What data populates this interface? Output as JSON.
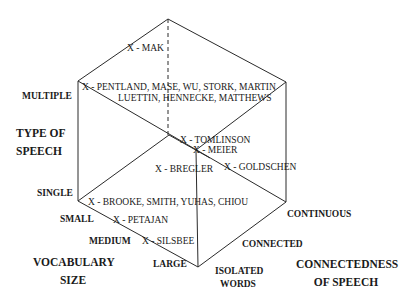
{
  "diagram": {
    "type": "3d-cube-classification",
    "axes": {
      "type_of_speech": {
        "title_line1": "TYPE OF",
        "title_line2": "SPEECH",
        "ticks": [
          "SINGLE",
          "MULTIPLE"
        ]
      },
      "vocabulary_size": {
        "title_line1": "VOCABULARY",
        "title_line2": "SIZE",
        "ticks": [
          "SMALL",
          "MEDIUM",
          "LARGE"
        ]
      },
      "connectedness": {
        "title_line1": "CONNECTEDNESS",
        "title_line2": "OF SPEECH",
        "ticks": [
          "ISOLATED",
          "WORDS",
          "CONNECTED",
          "CONTINUOUS"
        ]
      }
    },
    "points": [
      "X - MAK",
      "X - PENTLAND, MASE, WU, STORK, MARTIN",
      "LUETTIN, HENNECKE, MATTHEWS",
      "X - TOMLINSON",
      "X - MEIER",
      "X - BREGLER",
      "X - GOLDSCHEN",
      "X - BROOKE, SMITH, YUHAS, CHIOU",
      "X - PETAJAN",
      "X - SILSBEE"
    ],
    "line_color": "#2a2a2a"
  }
}
